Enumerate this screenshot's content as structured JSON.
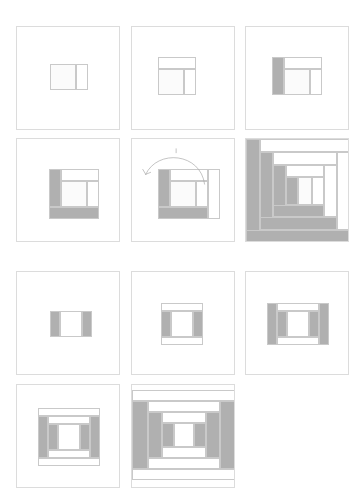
{
  "figure": {
    "canvas": {
      "width": 361,
      "height": 440,
      "background": "#ffffff"
    },
    "palette": {
      "light": "#fbfbfb",
      "white": "#ffffff",
      "dark": "#b0b0b0",
      "mid_dark": "#bdbdbd",
      "piece_outline": "#c9c9c9",
      "panel_border": "#dcdcdc",
      "arrow": "#a9a9a9"
    },
    "layout": {
      "columns": 3,
      "rows": 4,
      "panel_size": 104,
      "col_x": [
        16,
        131,
        245
      ],
      "row_y": [
        26,
        138,
        271,
        384
      ]
    }
  },
  "sequences": [
    {
      "name": "log-cabin",
      "label": "Log Cabin",
      "rows": [
        1,
        2
      ],
      "description": "Strips added in a spiral around the center square",
      "steps": [
        {
          "step": 1,
          "label": "Center square with first strip",
          "panel": "panel-1"
        },
        {
          "step": 2,
          "label": "Add light strip to top",
          "panel": "panel-2"
        },
        {
          "step": 3,
          "label": "Add dark strip to left",
          "panel": "panel-3"
        },
        {
          "step": 4,
          "label": "Add dark strip to bottom",
          "panel": "panel-4"
        },
        {
          "step": 5,
          "label": "Rotate and add light strip to right",
          "panel": "panel-5"
        },
        {
          "step": 6,
          "label": "Completed log cabin block",
          "panel": "panel-6"
        }
      ]
    },
    {
      "name": "courthouse-steps",
      "label": "Courthouse Steps",
      "rows": [
        3,
        4
      ],
      "description": "Strips added in opposing pairs around the center square",
      "steps": [
        {
          "step": 1,
          "label": "Center square with dark strips left and right",
          "panel": "panel-7"
        },
        {
          "step": 2,
          "label": "Add light strips top and bottom",
          "panel": "panel-8"
        },
        {
          "step": 3,
          "label": "Add dark strips left and right",
          "panel": "panel-9"
        },
        {
          "step": 4,
          "label": "Add light strips top and bottom",
          "panel": "panel-10"
        },
        {
          "step": 5,
          "label": "Completed courthouse steps block",
          "panel": "panel-11"
        }
      ]
    }
  ],
  "panels": [
    {
      "id": "panel-1",
      "row": 1,
      "col": 1,
      "x": 16,
      "y": 26,
      "w": 104,
      "h": 104,
      "block": {
        "x": 33,
        "y": 37,
        "w": 38,
        "h": 26
      },
      "pieces": [
        {
          "name": "center-square",
          "x": 0,
          "y": 0,
          "w": 26,
          "h": 26,
          "fill": "#fbfbfb"
        },
        {
          "name": "strip-right-1",
          "x": 26,
          "y": 0,
          "w": 12,
          "h": 26,
          "fill": "#ffffff"
        }
      ]
    },
    {
      "id": "panel-2",
      "row": 1,
      "col": 2,
      "x": 131,
      "y": 26,
      "w": 104,
      "h": 104,
      "block": {
        "x": 26,
        "y": 30,
        "w": 38,
        "h": 38
      },
      "pieces": [
        {
          "name": "strip-top-2",
          "x": 0,
          "y": 0,
          "w": 38,
          "h": 12,
          "fill": "#ffffff"
        },
        {
          "name": "center-square",
          "x": 0,
          "y": 12,
          "w": 26,
          "h": 26,
          "fill": "#fbfbfb"
        },
        {
          "name": "strip-right-1",
          "x": 26,
          "y": 12,
          "w": 12,
          "h": 26,
          "fill": "#ffffff"
        }
      ]
    },
    {
      "id": "panel-3",
      "row": 1,
      "col": 3,
      "x": 245,
      "y": 26,
      "w": 104,
      "h": 104,
      "block": {
        "x": 26,
        "y": 30,
        "w": 50,
        "h": 38
      },
      "pieces": [
        {
          "name": "strip-left-3",
          "x": 0,
          "y": 0,
          "w": 12,
          "h": 38,
          "fill": "#b0b0b0"
        },
        {
          "name": "strip-top-2",
          "x": 12,
          "y": 0,
          "w": 38,
          "h": 12,
          "fill": "#ffffff"
        },
        {
          "name": "center-square",
          "x": 12,
          "y": 12,
          "w": 26,
          "h": 26,
          "fill": "#fbfbfb"
        },
        {
          "name": "strip-right-1",
          "x": 38,
          "y": 12,
          "w": 12,
          "h": 26,
          "fill": "#ffffff"
        }
      ]
    },
    {
      "id": "panel-4",
      "row": 2,
      "col": 1,
      "x": 16,
      "y": 138,
      "w": 104,
      "h": 104,
      "block": {
        "x": 32,
        "y": 30,
        "w": 50,
        "h": 50
      },
      "pieces": [
        {
          "name": "strip-left-3",
          "x": 0,
          "y": 0,
          "w": 12,
          "h": 38,
          "fill": "#b0b0b0"
        },
        {
          "name": "strip-top-2",
          "x": 12,
          "y": 0,
          "w": 38,
          "h": 12,
          "fill": "#ffffff"
        },
        {
          "name": "center-square",
          "x": 12,
          "y": 12,
          "w": 26,
          "h": 26,
          "fill": "#fbfbfb"
        },
        {
          "name": "strip-right-1",
          "x": 38,
          "y": 12,
          "w": 12,
          "h": 26,
          "fill": "#ffffff"
        },
        {
          "name": "strip-bottom-4",
          "x": 0,
          "y": 38,
          "w": 50,
          "h": 12,
          "fill": "#b0b0b0"
        }
      ]
    },
    {
      "id": "panel-5",
      "row": 2,
      "col": 2,
      "x": 131,
      "y": 138,
      "w": 104,
      "h": 104,
      "block": {
        "x": 26,
        "y": 30,
        "w": 62,
        "h": 50
      },
      "has_arrow": true,
      "pieces": [
        {
          "name": "strip-left-3",
          "x": 0,
          "y": 0,
          "w": 12,
          "h": 38,
          "fill": "#b0b0b0"
        },
        {
          "name": "strip-top-2",
          "x": 12,
          "y": 0,
          "w": 38,
          "h": 12,
          "fill": "#ffffff"
        },
        {
          "name": "center-square",
          "x": 12,
          "y": 12,
          "w": 26,
          "h": 26,
          "fill": "#fbfbfb"
        },
        {
          "name": "strip-right-1",
          "x": 38,
          "y": 12,
          "w": 12,
          "h": 26,
          "fill": "#ffffff"
        },
        {
          "name": "strip-bottom-4",
          "x": 0,
          "y": 38,
          "w": 50,
          "h": 12,
          "fill": "#b0b0b0"
        },
        {
          "name": "strip-right-5",
          "x": 50,
          "y": 0,
          "w": 12,
          "h": 50,
          "fill": "#ffffff"
        }
      ]
    },
    {
      "id": "panel-6",
      "row": 2,
      "col": 3,
      "x": 245,
      "y": 138,
      "w": 104,
      "h": 104,
      "block": {
        "x": 0,
        "y": 0,
        "w": 104,
        "h": 104
      },
      "pieces": [
        {
          "name": "ring-5-left",
          "x": 0,
          "y": 0,
          "w": 14,
          "h": 104,
          "fill": "#b0b0b0"
        },
        {
          "name": "ring-5-top",
          "x": 14,
          "y": 0,
          "w": 90,
          "h": 13,
          "fill": "#ffffff"
        },
        {
          "name": "ring-5-bottom",
          "x": 0,
          "y": 91,
          "w": 104,
          "h": 13,
          "fill": "#b0b0b0"
        },
        {
          "name": "ring-5-right",
          "x": 91,
          "y": 13,
          "w": 13,
          "h": 78,
          "fill": "#ffffff"
        },
        {
          "name": "ring-4-left",
          "x": 14,
          "y": 13,
          "w": 13,
          "h": 78,
          "fill": "#b0b0b0"
        },
        {
          "name": "ring-4-top",
          "x": 27,
          "y": 13,
          "w": 64,
          "h": 13,
          "fill": "#ffffff"
        },
        {
          "name": "ring-4-bottom",
          "x": 14,
          "y": 78,
          "w": 77,
          "h": 13,
          "fill": "#b0b0b0"
        },
        {
          "name": "ring-4-right",
          "x": 78,
          "y": 26,
          "w": 13,
          "h": 52,
          "fill": "#ffffff"
        },
        {
          "name": "ring-3-left",
          "x": 27,
          "y": 26,
          "w": 13,
          "h": 52,
          "fill": "#b0b0b0"
        },
        {
          "name": "ring-3-top",
          "x": 40,
          "y": 26,
          "w": 38,
          "h": 12,
          "fill": "#ffffff"
        },
        {
          "name": "ring-3-bottom",
          "x": 27,
          "y": 66,
          "w": 51,
          "h": 12,
          "fill": "#b0b0b0"
        },
        {
          "name": "ring-3-right",
          "x": 66,
          "y": 38,
          "w": 12,
          "h": 28,
          "fill": "#ffffff"
        },
        {
          "name": "ring-2-left",
          "x": 40,
          "y": 38,
          "w": 12,
          "h": 28,
          "fill": "#b0b0b0"
        },
        {
          "name": "center-square",
          "x": 52,
          "y": 38,
          "w": 14,
          "h": 28,
          "fill": "#fbfbfb"
        }
      ]
    },
    {
      "id": "panel-7",
      "row": 3,
      "col": 1,
      "x": 16,
      "y": 271,
      "w": 104,
      "h": 104,
      "block": {
        "x": 33,
        "y": 39,
        "w": 42,
        "h": 26
      },
      "pieces": [
        {
          "name": "strip-left-1",
          "x": 0,
          "y": 0,
          "w": 10,
          "h": 26,
          "fill": "#b0b0b0"
        },
        {
          "name": "center-square",
          "x": 10,
          "y": 0,
          "w": 22,
          "h": 26,
          "fill": "#ffffff"
        },
        {
          "name": "strip-right-1",
          "x": 32,
          "y": 0,
          "w": 10,
          "h": 26,
          "fill": "#b0b0b0"
        }
      ]
    },
    {
      "id": "panel-8",
      "row": 3,
      "col": 2,
      "x": 131,
      "y": 271,
      "w": 104,
      "h": 104,
      "block": {
        "x": 29,
        "y": 31,
        "w": 42,
        "h": 42
      },
      "pieces": [
        {
          "name": "strip-top-2",
          "x": 0,
          "y": 0,
          "w": 42,
          "h": 8,
          "fill": "#ffffff"
        },
        {
          "name": "strip-left-1",
          "x": 0,
          "y": 8,
          "w": 10,
          "h": 26,
          "fill": "#b0b0b0"
        },
        {
          "name": "center-square",
          "x": 10,
          "y": 8,
          "w": 22,
          "h": 26,
          "fill": "#ffffff"
        },
        {
          "name": "strip-right-1",
          "x": 32,
          "y": 8,
          "w": 10,
          "h": 26,
          "fill": "#b0b0b0"
        },
        {
          "name": "strip-bottom-2",
          "x": 0,
          "y": 34,
          "w": 42,
          "h": 8,
          "fill": "#ffffff"
        }
      ]
    },
    {
      "id": "panel-9",
      "row": 3,
      "col": 3,
      "x": 245,
      "y": 271,
      "w": 104,
      "h": 104,
      "block": {
        "x": 21,
        "y": 31,
        "w": 62,
        "h": 42
      },
      "pieces": [
        {
          "name": "strip-left-3",
          "x": 0,
          "y": 0,
          "w": 10,
          "h": 42,
          "fill": "#b0b0b0"
        },
        {
          "name": "strip-right-3",
          "x": 52,
          "y": 0,
          "w": 10,
          "h": 42,
          "fill": "#b0b0b0"
        },
        {
          "name": "strip-top-2",
          "x": 10,
          "y": 0,
          "w": 42,
          "h": 8,
          "fill": "#ffffff"
        },
        {
          "name": "strip-left-1",
          "x": 10,
          "y": 8,
          "w": 10,
          "h": 26,
          "fill": "#b0b0b0"
        },
        {
          "name": "center-square",
          "x": 20,
          "y": 8,
          "w": 22,
          "h": 26,
          "fill": "#ffffff"
        },
        {
          "name": "strip-right-1",
          "x": 42,
          "y": 8,
          "w": 10,
          "h": 26,
          "fill": "#b0b0b0"
        },
        {
          "name": "strip-bottom-2",
          "x": 10,
          "y": 34,
          "w": 42,
          "h": 8,
          "fill": "#ffffff"
        }
      ]
    },
    {
      "id": "panel-10",
      "row": 4,
      "col": 1,
      "x": 16,
      "y": 384,
      "w": 104,
      "h": 104,
      "block": {
        "x": 21,
        "y": 23,
        "w": 62,
        "h": 58
      },
      "pieces": [
        {
          "name": "strip-top-4",
          "x": 0,
          "y": 0,
          "w": 62,
          "h": 8,
          "fill": "#ffffff"
        },
        {
          "name": "strip-left-3",
          "x": 0,
          "y": 8,
          "w": 10,
          "h": 42,
          "fill": "#b0b0b0"
        },
        {
          "name": "strip-right-3",
          "x": 52,
          "y": 8,
          "w": 10,
          "h": 42,
          "fill": "#b0b0b0"
        },
        {
          "name": "strip-top-2",
          "x": 10,
          "y": 8,
          "w": 42,
          "h": 8,
          "fill": "#ffffff"
        },
        {
          "name": "strip-left-1",
          "x": 10,
          "y": 16,
          "w": 10,
          "h": 26,
          "fill": "#b0b0b0"
        },
        {
          "name": "center-square",
          "x": 20,
          "y": 16,
          "w": 22,
          "h": 26,
          "fill": "#ffffff"
        },
        {
          "name": "strip-right-1",
          "x": 42,
          "y": 16,
          "w": 10,
          "h": 26,
          "fill": "#b0b0b0"
        },
        {
          "name": "strip-bottom-2",
          "x": 10,
          "y": 42,
          "w": 42,
          "h": 8,
          "fill": "#ffffff"
        },
        {
          "name": "strip-bottom-4",
          "x": 0,
          "y": 50,
          "w": 62,
          "h": 8,
          "fill": "#ffffff"
        }
      ]
    },
    {
      "id": "panel-11",
      "row": 4,
      "col": 2,
      "x": 131,
      "y": 384,
      "w": 104,
      "h": 104,
      "block": {
        "x": 0,
        "y": 5,
        "w": 104,
        "h": 90
      },
      "pieces": [
        {
          "name": "ring-5-top",
          "x": 0,
          "y": 0,
          "w": 104,
          "h": 11,
          "fill": "#ffffff"
        },
        {
          "name": "ring-5-bottom",
          "x": 0,
          "y": 79,
          "w": 104,
          "h": 11,
          "fill": "#ffffff"
        },
        {
          "name": "ring-5-left",
          "x": 0,
          "y": 11,
          "w": 16,
          "h": 68,
          "fill": "#b0b0b0"
        },
        {
          "name": "ring-5-right",
          "x": 88,
          "y": 11,
          "w": 16,
          "h": 68,
          "fill": "#b0b0b0"
        },
        {
          "name": "ring-4-top",
          "x": 16,
          "y": 11,
          "w": 72,
          "h": 11,
          "fill": "#ffffff"
        },
        {
          "name": "ring-4-bottom",
          "x": 16,
          "y": 68,
          "w": 72,
          "h": 11,
          "fill": "#ffffff"
        },
        {
          "name": "ring-4-left",
          "x": 16,
          "y": 22,
          "w": 14,
          "h": 46,
          "fill": "#b0b0b0"
        },
        {
          "name": "ring-4-right",
          "x": 74,
          "y": 22,
          "w": 14,
          "h": 46,
          "fill": "#b0b0b0"
        },
        {
          "name": "ring-3-top",
          "x": 30,
          "y": 22,
          "w": 44,
          "h": 11,
          "fill": "#ffffff"
        },
        {
          "name": "ring-3-bottom",
          "x": 30,
          "y": 57,
          "w": 44,
          "h": 11,
          "fill": "#ffffff"
        },
        {
          "name": "ring-3-left",
          "x": 30,
          "y": 33,
          "w": 12,
          "h": 24,
          "fill": "#b0b0b0"
        },
        {
          "name": "ring-3-right",
          "x": 62,
          "y": 33,
          "w": 12,
          "h": 24,
          "fill": "#b0b0b0"
        },
        {
          "name": "center-square",
          "x": 42,
          "y": 33,
          "w": 20,
          "h": 24,
          "fill": "#ffffff"
        }
      ]
    }
  ],
  "arrow": {
    "name": "rotate-counterclockwise-arrow",
    "panel": "panel-5",
    "color": "#a9a9a9",
    "stroke_width": 0.7,
    "path": "M 74 46 C 70 14, 26 10, 14 36",
    "head": "M 14 36 L 11 31 M 14 36 L 19 34",
    "tick": "M 45 10 L 45 14"
  }
}
